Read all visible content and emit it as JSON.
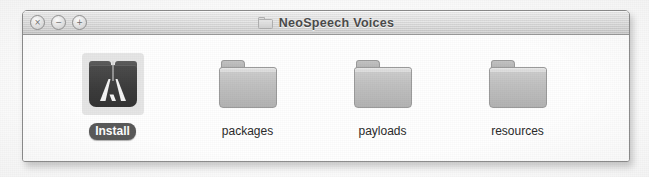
{
  "window": {
    "title": "NeoSpeech Voices",
    "title_icon": "folder-icon",
    "controls": [
      {
        "name": "close-button",
        "glyph": "×"
      },
      {
        "name": "minimize-button",
        "glyph": "−"
      },
      {
        "name": "zoom-button",
        "glyph": "+"
      }
    ]
  },
  "content": {
    "view": "icon-view",
    "items": [
      {
        "label": "Install",
        "kind": "package",
        "selected": true
      },
      {
        "label": "packages",
        "kind": "folder",
        "selected": false
      },
      {
        "label": "payloads",
        "kind": "folder",
        "selected": false
      },
      {
        "label": "resources",
        "kind": "folder",
        "selected": false
      }
    ]
  },
  "colors": {
    "titlebar_top": "#f2f2f2",
    "titlebar_bottom": "#c7c7c7",
    "window_border": "#8e8e8e",
    "content_background": "#ffffff",
    "selection_label": "#5a5a5a",
    "folder_fill": "#c0c0c0",
    "package_fill": "#3d3d3d",
    "label_text": "#2b2b2b"
  }
}
